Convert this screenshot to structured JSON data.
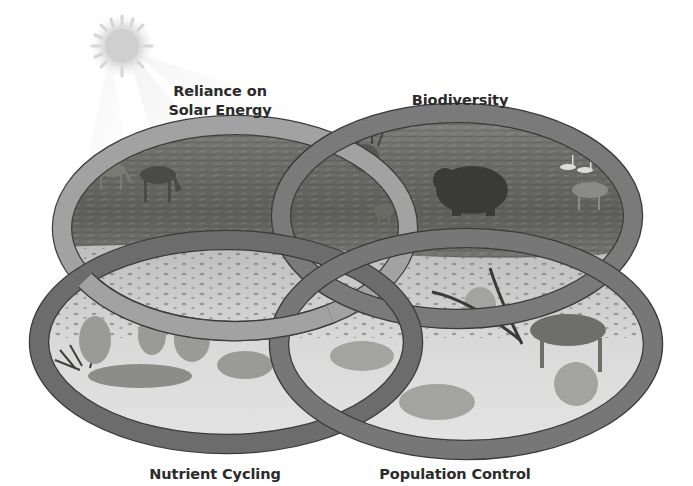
{
  "diagram": {
    "type": "overlapping-ellipses",
    "style": "grayscale photo-illustration, four interlocking rings",
    "sun_icon": "sun-icon",
    "labels": {
      "solar": [
        "Reliance on",
        "Solar Energy"
      ],
      "biodiversity": "Biodiversity",
      "nutrient": "Nutrient Cycling",
      "population": "Population Control"
    },
    "rings": [
      {
        "name": "Reliance on Solar Energy",
        "position": "top-left",
        "scene": "tundra with grazing caribou"
      },
      {
        "name": "Biodiversity",
        "position": "top-right",
        "scene": "caribou, snowy owl, grizzly bear, wolf, fox, swans, hare"
      },
      {
        "name": "Nutrient Cycling",
        "position": "bottom-left",
        "scene": "wolves feeding on caribou carcass in snow"
      },
      {
        "name": "Population Control",
        "position": "bottom-right",
        "scene": "wolves attacking caribou in snow"
      }
    ],
    "colors": {
      "background": "#ffffff",
      "ring_dark": "#6e6e6e",
      "ring_light": "#9a9a9a",
      "label_text": "#2b2b2b",
      "tundra": "#6a6a66",
      "snow": "#d8d8d8"
    }
  }
}
